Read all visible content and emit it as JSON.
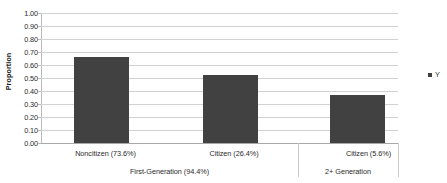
{
  "chart_data": {
    "type": "bar",
    "title": "",
    "xlabel": "",
    "ylabel": "Proportion",
    "ylim": [
      0,
      1
    ],
    "grid": true,
    "legend_position": "right",
    "categories": [
      "Noncitizen (73.6%)",
      "Citizen (26.4%)",
      "Citizen (5.6%)"
    ],
    "values": [
      0.665,
      0.52,
      0.37
    ],
    "groups": [
      {
        "label": "First-Generation (94.4%)",
        "categories": [
          "Noncitizen (73.6%)",
          "Citizen (26.4%)"
        ]
      },
      {
        "label": "2+ Generation",
        "categories": [
          "Citizen (5.6%)"
        ]
      }
    ],
    "series": [
      {
        "name": "Y",
        "values": [
          0.665,
          0.52,
          0.37
        ],
        "color": "#414141"
      }
    ],
    "ytick_labels": [
      "1.00",
      "0.90",
      "0.80",
      "0.70",
      "0.60",
      "0.50",
      "0.40",
      "0.30",
      "0.20",
      "0.10",
      "0.00"
    ],
    "ytick_values": [
      1.0,
      0.9,
      0.8,
      0.7,
      0.6,
      0.5,
      0.4,
      0.3,
      0.2,
      0.1,
      0.0
    ],
    "legend_entries": [
      {
        "label": "Y",
        "color": "#414141"
      }
    ]
  },
  "colors": {
    "bar": "#414141",
    "gridline": "#d2d2d2",
    "axis": "#b9b9b9",
    "text": "#2b2b2b",
    "background": "#ffffff"
  }
}
